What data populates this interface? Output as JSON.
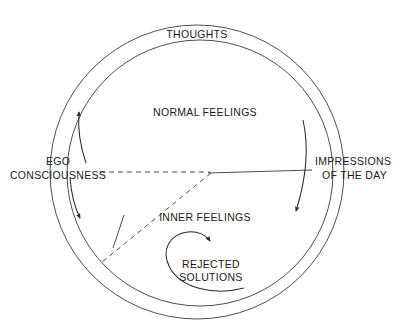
{
  "diagram": {
    "background_color": "#ffffff",
    "stroke_color": "#2b2b2b",
    "labels": {
      "thoughts": "THOUGHTS",
      "normal_feelings": "NORMAL FEELINGS",
      "inner_feelings": "INNER FEELINGS",
      "rejected_solutions_line1": "REJECTED",
      "rejected_solutions_line2": "SOLUTIONS",
      "ego_line1": "EGO",
      "ego_line2": "CONSCIOUSNESS",
      "impressions_line1": "IMPRESSIONS",
      "impressions_line2": "OF THE DAY"
    },
    "shapes": {
      "outer_circle": {
        "name": "outer-circle",
        "cx": 197,
        "cy": 172,
        "r": 147
      },
      "inner_circle": {
        "name": "inner-circle",
        "cx": 200,
        "cy": 173,
        "r": 133
      }
    },
    "connectors": {
      "horizontal_dashed": "ego-consciousness to centre dashed line",
      "horizontal_solid": "centre to impressions of the day solid line",
      "diagonal_dashed": "centre to lower-left dashed line",
      "radial_tick": "short solid radial segment meeting diagonal",
      "left_arrow_up": "upward arc arrow between circles on left",
      "left_arrow_down": "downward arc arrow between circles on left",
      "right_arrow_down": "downward arc arrow inside circle on right",
      "rejected_spiral": "counter-clockwise spiral arrow around rejected solutions"
    }
  }
}
